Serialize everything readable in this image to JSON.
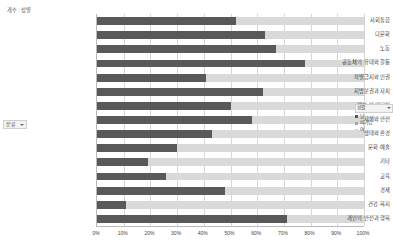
{
  "pivot": {
    "column_field_label": "개수 : 성별",
    "row_field_label": "분류",
    "dropdown_icon": "chevron-down-icon"
  },
  "legend": {
    "title": "성별",
    "filter_icon": "chevron-down-icon",
    "items": [
      {
        "label": "남",
        "color": "#595959"
      },
      {
        "label": "미기입",
        "color": "#a6a6a6"
      },
      {
        "label": "여",
        "color": "#d9d9d9"
      }
    ]
  },
  "chart_data": {
    "type": "bar",
    "orientation": "horizontal",
    "stacked": "100%",
    "title": "개수 : 성별",
    "xlabel": "",
    "ylabel": "분류",
    "xlim": [
      0,
      100
    ],
    "xticks": [
      "0%",
      "10%",
      "20%",
      "30%",
      "40%",
      "50%",
      "60%",
      "70%",
      "80%",
      "90%",
      "100%"
    ],
    "grid": true,
    "legend_position": "right",
    "categories": [
      "사회통합",
      "다문화",
      "노동",
      "공동체의 유대와 갈등",
      "차별금지와 인권",
      "지방분권과 자치",
      "정보 및 미디어",
      "재해와 안전",
      "생태와 환경",
      "문화·예술",
      "기타",
      "교육",
      "경제",
      "건강·복지",
      "개인의 안전과 행복"
    ],
    "series": [
      {
        "name": "남",
        "color": "#595959",
        "values": [
          52,
          63,
          67,
          78,
          41,
          62,
          50,
          58,
          43,
          30,
          19,
          26,
          48,
          11,
          71
        ]
      },
      {
        "name": "여",
        "color": "#d9d9d9",
        "values": [
          48,
          37,
          33,
          22,
          59,
          38,
          50,
          42,
          57,
          70,
          81,
          74,
          52,
          89,
          29
        ]
      }
    ]
  }
}
